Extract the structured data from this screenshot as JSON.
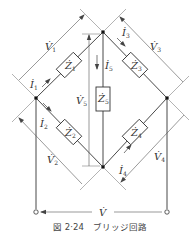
{
  "figure": {
    "caption": "図 2·24　ブリッジ回路",
    "type": "bridge-circuit"
  },
  "nodes": {
    "top": {
      "x": 103,
      "y": 32
    },
    "left": {
      "x": 36,
      "y": 98
    },
    "right": {
      "x": 167,
      "y": 98
    },
    "bottom": {
      "x": 103,
      "y": 167
    },
    "terminal_left": {
      "x": 36,
      "y": 212
    },
    "terminal_right": {
      "x": 167,
      "y": 212
    }
  },
  "impedances": [
    {
      "id": "Z1",
      "label": "Z",
      "sub": "1",
      "branch": "left-top"
    },
    {
      "id": "Z2",
      "label": "Z",
      "sub": "2",
      "branch": "left-bottom"
    },
    {
      "id": "Z3",
      "label": "Z",
      "sub": "3",
      "branch": "top-right"
    },
    {
      "id": "Z4",
      "label": "Z",
      "sub": "4",
      "branch": "bottom-right"
    },
    {
      "id": "Z5",
      "label": "Z",
      "sub": "5",
      "branch": "top-bottom"
    }
  ],
  "currents": [
    {
      "id": "I1",
      "label": "I",
      "sub": "1"
    },
    {
      "id": "I2",
      "label": "I",
      "sub": "2"
    },
    {
      "id": "I3",
      "label": "I",
      "sub": "3"
    },
    {
      "id": "I4",
      "label": "I",
      "sub": "4"
    },
    {
      "id": "I5",
      "label": "I",
      "sub": "5"
    }
  ],
  "voltages": [
    {
      "id": "V1",
      "label": "V",
      "sub": "1"
    },
    {
      "id": "V2",
      "label": "V",
      "sub": "2"
    },
    {
      "id": "V3",
      "label": "V",
      "sub": "3"
    },
    {
      "id": "V4",
      "label": "V",
      "sub": "4"
    },
    {
      "id": "V5",
      "label": "V",
      "sub": "5"
    },
    {
      "id": "V",
      "label": "V",
      "sub": ""
    }
  ],
  "colors": {
    "wire": "#333333",
    "annotation": "#555555",
    "background": "#ffffff"
  }
}
